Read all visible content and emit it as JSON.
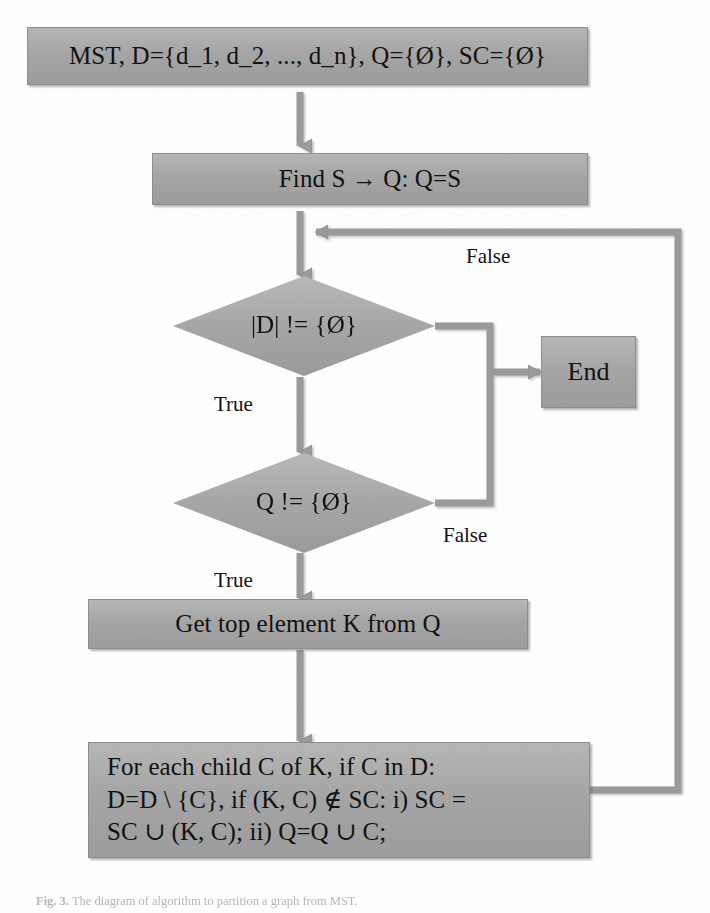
{
  "figure": {
    "type": "flowchart",
    "caption_prefix": "Fig. 3.",
    "caption_text": "The diagram of algorithm to partition a graph from MST.",
    "background_color": "#ffffff",
    "node_fill_color": "#a8a8a8",
    "node_border_color": "#8d8d8d",
    "text_color": "#111111",
    "connector_color": "#9a9a9a"
  },
  "nodes": {
    "start": {
      "id": "start",
      "shape": "process",
      "label": "MST, D={d_1, d_2, ..., d_n}, Q={Ø}, SC={Ø}"
    },
    "find_s": {
      "id": "find_s",
      "shape": "process",
      "label": "Find S → Q: Q=S"
    },
    "decision_d": {
      "id": "decision_d",
      "shape": "decision",
      "label": "|D| != {Ø}"
    },
    "decision_q": {
      "id": "decision_q",
      "shape": "decision",
      "label": "Q != {Ø}"
    },
    "get_top": {
      "id": "get_top",
      "shape": "process",
      "label": "Get top element K from Q"
    },
    "for_each": {
      "id": "for_each",
      "shape": "process",
      "label": "For each child C of K, if C in D:\nD=D \\ {C}, if (K, C) ∉ SC: i) SC =\nSC ∪ (K, C); ii) Q=Q ∪ C;"
    },
    "end": {
      "id": "end",
      "shape": "process",
      "label": "End"
    }
  },
  "edge_labels": {
    "d_false": "False",
    "d_true": "True",
    "q_false": "False",
    "q_true": "True"
  },
  "edges": [
    {
      "from": "start",
      "to": "find_s",
      "label": ""
    },
    {
      "from": "find_s",
      "to": "decision_d",
      "label": ""
    },
    {
      "from": "decision_d",
      "to": "decision_q",
      "label": "True"
    },
    {
      "from": "decision_d",
      "to": "end",
      "label": "False"
    },
    {
      "from": "decision_q",
      "to": "get_top",
      "label": "True"
    },
    {
      "from": "decision_q",
      "to": "end",
      "label": "False"
    },
    {
      "from": "get_top",
      "to": "for_each",
      "label": ""
    },
    {
      "from": "for_each",
      "to": "find_s",
      "label": ""
    }
  ]
}
